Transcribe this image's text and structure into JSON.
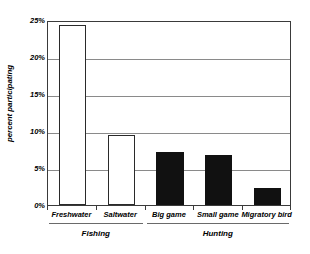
{
  "chart_data": {
    "type": "bar",
    "title": "",
    "subtitle": "",
    "xlabel": "",
    "ylabel": "percent participating",
    "ylim": [
      0,
      25
    ],
    "grid": true,
    "legend": "none",
    "categories": [
      "Freshwater",
      "Saltwater",
      "Big game",
      "Small game",
      "Migratory bird"
    ],
    "values": [
      24.3,
      9.4,
      7.2,
      6.7,
      2.3
    ],
    "bar_styles": [
      "hollow",
      "hollow",
      "filled",
      "filled",
      "filled"
    ],
    "ytick_labels": [
      "25%",
      "20%",
      "15%",
      "10%",
      "5%",
      "0%"
    ],
    "ytick_values": [
      25,
      20,
      15,
      10,
      5,
      0
    ],
    "groups": [
      {
        "label": "Fishing",
        "categories": [
          "Freshwater",
          "Saltwater"
        ]
      },
      {
        "label": "Hunting",
        "categories": [
          "Big game",
          "Small game",
          "Migratory bird"
        ]
      }
    ],
    "colors": {
      "hollow_fill": "#ffffff",
      "hollow_stroke": "#2a2a2a",
      "filled_fill": "#111111",
      "gridline": "#8a8a8a",
      "axis": "#3a3a3a",
      "background": "#ffffff",
      "text": "#000000"
    }
  }
}
